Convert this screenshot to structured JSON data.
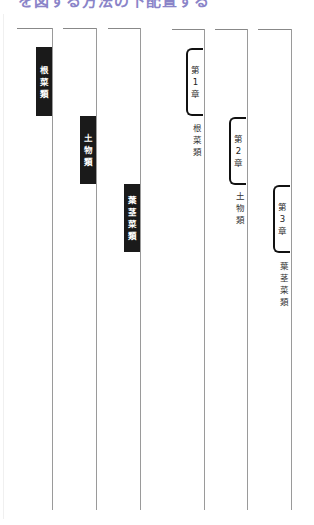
{
  "heading": "を図する方法の下配置する",
  "left_pages": [
    {
      "tab_label": "根菜類",
      "chars": [
        "根",
        "菜",
        "類"
      ]
    },
    {
      "tab_label": "土物類",
      "chars": [
        "土",
        "物",
        "類"
      ]
    },
    {
      "tab_label": "葉茎菜類",
      "chars": [
        "葉",
        "茎",
        "菜",
        "類"
      ]
    }
  ],
  "right_pages": [
    {
      "chapter": "第1章",
      "chapter_chars": [
        "第",
        "1",
        "章"
      ],
      "label": "根菜類",
      "label_chars": [
        "根",
        "菜",
        "類"
      ]
    },
    {
      "chapter": "第2章",
      "chapter_chars": [
        "第",
        "2",
        "章"
      ],
      "label": "土物類",
      "label_chars": [
        "土",
        "物",
        "類"
      ]
    },
    {
      "chapter": "第3章",
      "chapter_chars": [
        "第",
        "3",
        "章"
      ],
      "label": "葉茎菜類",
      "label_chars": [
        "葉",
        "茎",
        "菜",
        "類"
      ]
    }
  ],
  "colors": {
    "tab_fill": "#1a1a1a",
    "heading": "#8a84c8",
    "line": "#9a9a9a"
  }
}
